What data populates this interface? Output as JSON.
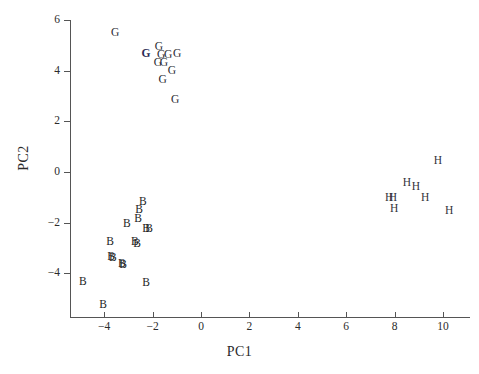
{
  "chart_data": {
    "type": "scatter",
    "title": "",
    "xlabel": "PC1",
    "ylabel": "PC2",
    "xlim": [
      -5.4,
      11.1
    ],
    "ylim": [
      -5.8,
      6.6
    ],
    "xticks": [
      -4,
      -2,
      0,
      2,
      4,
      6,
      8,
      10
    ],
    "xtick_labels": [
      "−4",
      "−2",
      "0",
      "2",
      "4",
      "6",
      "8",
      "10"
    ],
    "yticks": [
      -4,
      -2,
      0,
      2,
      4,
      6
    ],
    "ytick_labels": [
      "−4",
      "−2",
      "0",
      "2",
      "4",
      "6"
    ],
    "grid": false,
    "legend": "none",
    "marker_style": "text-label",
    "groups": [
      {
        "name": "G",
        "label": "G",
        "color": "#2b2b33",
        "points": [
          {
            "x": -3.55,
            "y": 5.5
          },
          {
            "x": -1.74,
            "y": 4.94
          },
          {
            "x": -2.27,
            "y": 4.66
          },
          {
            "x": -1.65,
            "y": 4.62,
            "bold": false
          },
          {
            "x": -1.36,
            "y": 4.62
          },
          {
            "x": -0.99,
            "y": 4.66
          },
          {
            "x": -1.78,
            "y": 4.31
          },
          {
            "x": -1.53,
            "y": 4.31
          },
          {
            "x": -1.2,
            "y": 3.99
          },
          {
            "x": -1.58,
            "y": 3.64
          },
          {
            "x": -1.07,
            "y": 2.85
          }
        ],
        "bold_point": {
          "x": -2.27,
          "y": 4.66
        }
      },
      {
        "name": "B",
        "label": "B",
        "color": "#1d1d1d",
        "points": [
          {
            "x": -2.4,
            "y": -1.19
          },
          {
            "x": -2.56,
            "y": -1.5
          },
          {
            "x": -2.6,
            "y": -1.86
          },
          {
            "x": -3.06,
            "y": -2.06
          },
          {
            "x": -2.27,
            "y": -2.25
          },
          {
            "x": -2.15,
            "y": -2.25
          },
          {
            "x": -3.76,
            "y": -2.77
          },
          {
            "x": -2.73,
            "y": -2.77
          },
          {
            "x": -2.64,
            "y": -2.85
          },
          {
            "x": -3.72,
            "y": -3.36
          },
          {
            "x": -3.64,
            "y": -3.4
          },
          {
            "x": -3.27,
            "y": -3.64
          },
          {
            "x": -3.22,
            "y": -3.68
          },
          {
            "x": -4.88,
            "y": -4.35
          },
          {
            "x": -2.27,
            "y": -4.39
          },
          {
            "x": -4.05,
            "y": -5.26
          }
        ]
      },
      {
        "name": "H",
        "label": "H",
        "color": "#33333a",
        "points": [
          {
            "x": 9.79,
            "y": 0.43
          },
          {
            "x": 8.51,
            "y": -0.43
          },
          {
            "x": 8.88,
            "y": -0.59
          },
          {
            "x": 7.77,
            "y": -1.03
          },
          {
            "x": 7.93,
            "y": -1.03
          },
          {
            "x": 9.26,
            "y": -1.03
          },
          {
            "x": 7.98,
            "y": -1.46
          },
          {
            "x": 10.25,
            "y": -1.54
          }
        ]
      }
    ]
  },
  "axes": {
    "x_title": "PC1",
    "y_title": "PC2"
  }
}
